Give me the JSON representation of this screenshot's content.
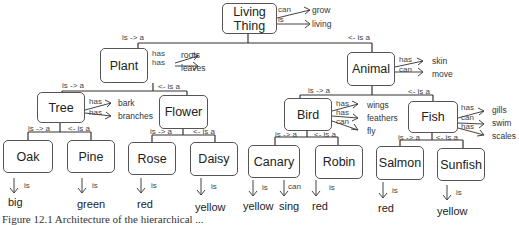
{
  "nodes": {
    "living_thing": {
      "line1": "Living",
      "line2": "Thing"
    },
    "plant": "Plant",
    "animal": "Animal",
    "tree": "Tree",
    "flower": "Flower",
    "bird": "Bird",
    "fish": "Fish",
    "oak": "Oak",
    "pine": "Pine",
    "rose": "Rose",
    "daisy": "Daisy",
    "canary": "Canary",
    "robin": "Robin",
    "salmon": "Salmon",
    "sunfish": "Sunfish"
  },
  "edge_labels": {
    "is_a_left": "is -> a",
    "is_a_right": "<- is a",
    "has": "has",
    "can": "can",
    "is": "is"
  },
  "properties": {
    "living_thing": [
      {
        "rel": "can",
        "value": "grow"
      },
      {
        "rel": "is",
        "value": "living"
      }
    ],
    "plant": [
      {
        "rel": "has",
        "value": "roots"
      },
      {
        "rel": "has",
        "value": "leaves"
      }
    ],
    "animal": [
      {
        "rel": "has",
        "value": "skin"
      },
      {
        "rel": "can",
        "value": "move"
      }
    ],
    "tree": [
      {
        "rel": "has",
        "value": "bark"
      },
      {
        "rel": "has",
        "value": "branches"
      }
    ],
    "bird": [
      {
        "rel": "has",
        "value": "wings"
      },
      {
        "rel": "has",
        "value": "feathers"
      },
      {
        "rel": "can",
        "value": "fly"
      }
    ],
    "fish": [
      {
        "rel": "has",
        "value": "gills"
      },
      {
        "rel": "can",
        "value": "swim"
      },
      {
        "rel": "has",
        "value": "scales"
      }
    ],
    "oak": [
      {
        "rel": "is",
        "value": "big"
      }
    ],
    "pine": [
      {
        "rel": "is",
        "value": "green"
      }
    ],
    "rose": [
      {
        "rel": "is",
        "value": "red"
      }
    ],
    "daisy": [
      {
        "rel": "is",
        "value": "yellow"
      }
    ],
    "canary": [
      {
        "rel": "is",
        "value": "yellow"
      },
      {
        "rel": "can",
        "value": "sing"
      }
    ],
    "robin": [
      {
        "rel": "is",
        "value": "red"
      }
    ],
    "salmon": [
      {
        "rel": "is",
        "value": "red"
      }
    ],
    "sunfish": [
      {
        "rel": "is",
        "value": "yellow"
      }
    ]
  },
  "caption": "Figure 12.1  Architecture of the hierarchical ..."
}
